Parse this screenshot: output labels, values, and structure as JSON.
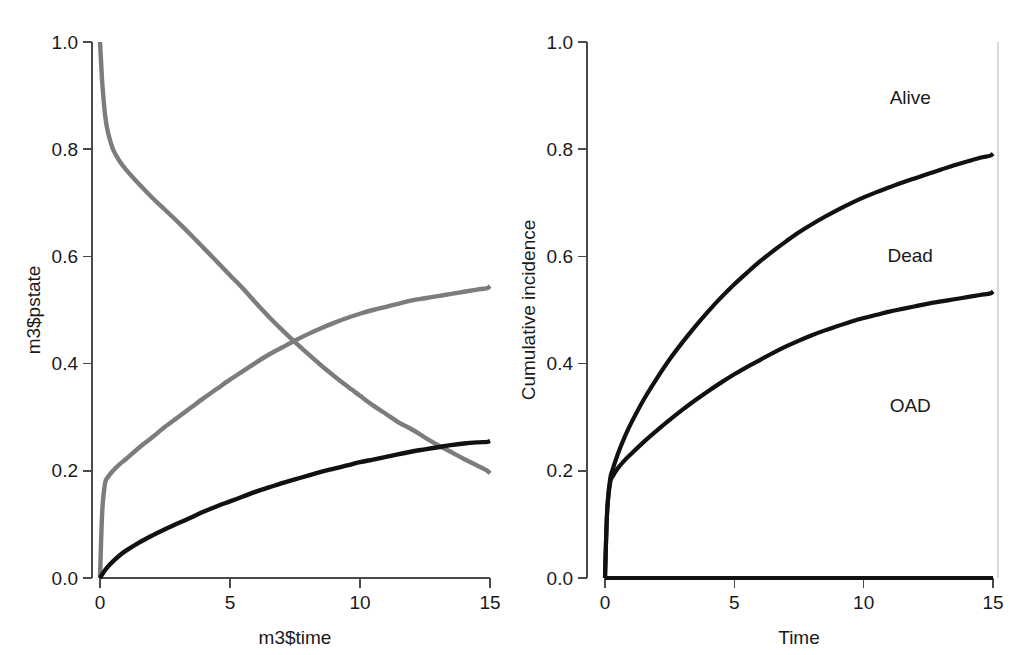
{
  "figure": {
    "title": "",
    "background": "#ffffff",
    "width": 1030,
    "height": 655
  },
  "panels": [
    {
      "id": "left",
      "name": "state-occupancy-probabilities",
      "xlabel": "m3$time",
      "ylabel": "m3$pstate",
      "xticks": [
        "0",
        "5",
        "10",
        "15"
      ],
      "yticks": [
        "0.0",
        "0.2",
        "0.4",
        "0.6",
        "0.8",
        "1.0"
      ],
      "annotations": []
    },
    {
      "id": "right",
      "name": "cumulative-incidence",
      "xlabel": "Time",
      "ylabel": "Cumulative incidence",
      "xticks": [
        "0",
        "5",
        "10",
        "15"
      ],
      "yticks": [
        "0.0",
        "0.2",
        "0.4",
        "0.6",
        "0.8",
        "1.0"
      ],
      "annotations": [
        {
          "text": "Alive",
          "x": 11.8,
          "y": 0.895
        },
        {
          "text": "Dead",
          "x": 11.8,
          "y": 0.6
        },
        {
          "text": "OAD",
          "x": 11.8,
          "y": 0.32
        }
      ]
    }
  ],
  "colors": {
    "gray_series": "#7c7c7c",
    "black_series": "#111111",
    "axis": "#4a4a4a",
    "boundary": "#c8c8c8",
    "text": "#1a1a1a",
    "background": "#ffffff"
  },
  "chart_data": [
    {
      "type": "line",
      "title": "",
      "xlabel": "m3$time",
      "ylabel": "m3$pstate",
      "xlim": [
        0,
        15
      ],
      "ylim": [
        0.0,
        1.0
      ],
      "xticks": [
        0,
        5,
        10,
        15
      ],
      "yticks": [
        0.0,
        0.2,
        0.4,
        0.6,
        0.8,
        1.0
      ],
      "grid": false,
      "legend": "none",
      "x": [
        0,
        0.05,
        0.1,
        0.2,
        0.3,
        0.5,
        0.75,
        1,
        1.5,
        2,
        2.5,
        3,
        3.5,
        4,
        4.5,
        5,
        5.5,
        6,
        6.5,
        7,
        7.5,
        8,
        8.5,
        9,
        9.5,
        10,
        10.5,
        11,
        11.5,
        12,
        12.5,
        13,
        13.5,
        14,
        14.5,
        14.9,
        15
      ],
      "series": [
        {
          "name": "state-1-declining",
          "color": "#7c7c7c",
          "values": [
            1.0,
            0.955,
            0.915,
            0.862,
            0.833,
            0.8,
            0.778,
            0.762,
            0.735,
            0.71,
            0.687,
            0.664,
            0.64,
            0.615,
            0.59,
            0.565,
            0.54,
            0.513,
            0.487,
            0.463,
            0.44,
            0.418,
            0.397,
            0.377,
            0.358,
            0.34,
            0.322,
            0.306,
            0.29,
            0.277,
            0.262,
            0.248,
            0.235,
            0.222,
            0.21,
            0.2,
            0.195
          ]
        },
        {
          "name": "state-2-rising",
          "color": "#7c7c7c",
          "values": [
            0.0,
            0.08,
            0.135,
            0.178,
            0.188,
            0.2,
            0.212,
            0.222,
            0.243,
            0.262,
            0.282,
            0.3,
            0.318,
            0.336,
            0.353,
            0.37,
            0.386,
            0.402,
            0.417,
            0.43,
            0.443,
            0.455,
            0.466,
            0.476,
            0.485,
            0.493,
            0.5,
            0.506,
            0.512,
            0.518,
            0.522,
            0.526,
            0.53,
            0.534,
            0.538,
            0.541,
            0.545
          ]
        },
        {
          "name": "state-3-black",
          "color": "#111111",
          "values": [
            0.0,
            0.004,
            0.008,
            0.015,
            0.021,
            0.031,
            0.042,
            0.051,
            0.066,
            0.079,
            0.091,
            0.102,
            0.113,
            0.124,
            0.134,
            0.143,
            0.152,
            0.161,
            0.169,
            0.177,
            0.184,
            0.191,
            0.198,
            0.204,
            0.21,
            0.216,
            0.221,
            0.226,
            0.231,
            0.236,
            0.24,
            0.244,
            0.248,
            0.251,
            0.253,
            0.254,
            0.256
          ]
        }
      ]
    },
    {
      "type": "line",
      "title": "",
      "xlabel": "Time",
      "ylabel": "Cumulative incidence",
      "xlim": [
        0,
        15
      ],
      "ylim": [
        0.0,
        1.0
      ],
      "xticks": [
        0,
        5,
        10,
        15
      ],
      "yticks": [
        0.0,
        0.2,
        0.4,
        0.6,
        0.8,
        1.0
      ],
      "grid": false,
      "legend": "inline-annotations",
      "x": [
        0,
        0.05,
        0.1,
        0.2,
        0.3,
        0.5,
        0.75,
        1,
        1.5,
        2,
        2.5,
        3,
        3.5,
        4,
        4.5,
        5,
        5.5,
        6,
        6.5,
        7,
        7.5,
        8,
        8.5,
        9,
        9.5,
        10,
        10.5,
        11,
        11.5,
        12,
        12.5,
        13,
        13.5,
        14,
        14.5,
        14.9,
        15
      ],
      "series": [
        {
          "name": "alive-upper",
          "color": "#111111",
          "values": [
            0.0,
            0.085,
            0.14,
            0.185,
            0.203,
            0.232,
            0.262,
            0.288,
            0.333,
            0.372,
            0.408,
            0.44,
            0.47,
            0.498,
            0.524,
            0.548,
            0.57,
            0.591,
            0.61,
            0.628,
            0.645,
            0.66,
            0.674,
            0.687,
            0.699,
            0.71,
            0.72,
            0.729,
            0.738,
            0.746,
            0.754,
            0.762,
            0.77,
            0.777,
            0.784,
            0.788,
            0.792
          ]
        },
        {
          "name": "dead-middle",
          "color": "#111111",
          "values": [
            0.0,
            0.082,
            0.135,
            0.178,
            0.19,
            0.205,
            0.219,
            0.231,
            0.254,
            0.275,
            0.295,
            0.314,
            0.332,
            0.349,
            0.365,
            0.38,
            0.394,
            0.407,
            0.42,
            0.432,
            0.443,
            0.453,
            0.462,
            0.47,
            0.478,
            0.485,
            0.491,
            0.497,
            0.502,
            0.507,
            0.512,
            0.516,
            0.52,
            0.524,
            0.528,
            0.531,
            0.535
          ]
        },
        {
          "name": "oad-baseline",
          "color": "#111111",
          "values": [
            0.0,
            0.0,
            0.0,
            0.0,
            0.0,
            0.0,
            0.0,
            0.0,
            0.0,
            0.0,
            0.0,
            0.0,
            0.0,
            0.0,
            0.0,
            0.0,
            0.0,
            0.0,
            0.0,
            0.0,
            0.0,
            0.0,
            0.0,
            0.0,
            0.0,
            0.0,
            0.0,
            0.0,
            0.0,
            0.0,
            0.0,
            0.0,
            0.0,
            0.0,
            0.0,
            0.0,
            0.0
          ]
        }
      ],
      "annotations": [
        {
          "text": "Alive",
          "x": 11.8,
          "y": 0.895
        },
        {
          "text": "Dead",
          "x": 11.8,
          "y": 0.6
        },
        {
          "text": "OAD",
          "x": 11.8,
          "y": 0.32
        }
      ]
    }
  ]
}
